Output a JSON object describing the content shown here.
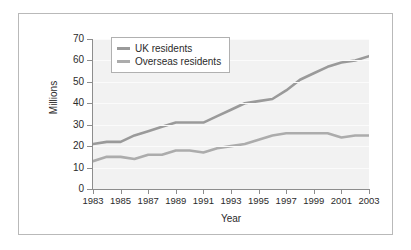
{
  "chart_data": {
    "type": "line",
    "title": "",
    "xlabel": "Year",
    "ylabel": "Millions",
    "xlim": [
      1983,
      2003
    ],
    "ylim": [
      0,
      70
    ],
    "ytick_step": 10,
    "yticks": [
      0,
      10,
      20,
      30,
      40,
      50,
      60,
      70
    ],
    "xticks": [
      1983,
      1985,
      1987,
      1989,
      1991,
      1993,
      1995,
      1997,
      1999,
      2001,
      2003
    ],
    "x": [
      1983,
      1984,
      1985,
      1986,
      1987,
      1988,
      1989,
      1990,
      1991,
      1992,
      1993,
      1994,
      1995,
      1996,
      1997,
      1998,
      1999,
      2000,
      2001,
      2002,
      2003
    ],
    "grid": "horizontal",
    "legend_position": "upper-left",
    "series": [
      {
        "name": "UK residents",
        "color": "#9a9a9a",
        "values": [
          21,
          22,
          22,
          25,
          27,
          29,
          31,
          31,
          31,
          34,
          37,
          40,
          41,
          42,
          46,
          51,
          54,
          57,
          59,
          60,
          62
        ]
      },
      {
        "name": "Overseas residents",
        "color": "#acacac",
        "values": [
          13,
          15,
          15,
          14,
          16,
          16,
          18,
          18,
          17,
          19,
          20,
          21,
          23,
          25,
          26,
          26,
          26,
          26,
          24,
          25,
          25
        ]
      }
    ]
  },
  "axis": {
    "ytick_labels": [
      "0",
      "10",
      "20",
      "30",
      "40",
      "50",
      "60",
      "70"
    ],
    "xtick_labels": [
      "1983",
      "1985",
      "1987",
      "1989",
      "1991",
      "1993",
      "1995",
      "1997",
      "1999",
      "2001",
      "2003"
    ],
    "ylabel": "Millions",
    "xlabel": "Year"
  },
  "legend": {
    "items": [
      {
        "label": "UK residents",
        "color": "#9a9a9a"
      },
      {
        "label": "Overseas residents",
        "color": "#acacac"
      }
    ]
  }
}
